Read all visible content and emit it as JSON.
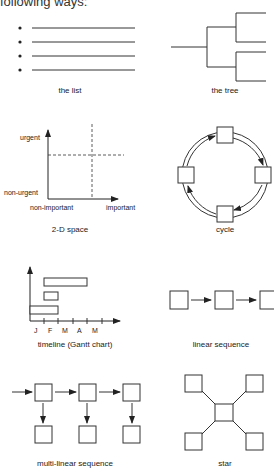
{
  "intro_text": "following ways:",
  "panels": {
    "list": {
      "caption": "the list"
    },
    "tree": {
      "caption": "the tree"
    },
    "space2d": {
      "caption": "2-D space",
      "y_top": "urgent",
      "y_bottom": "non-urgent",
      "x_left": "non-important",
      "x_right": "important"
    },
    "cycle": {
      "caption": "cycle"
    },
    "gantt": {
      "caption": "timeline (Gantt chart)",
      "months": [
        "J",
        "F",
        "M",
        "A",
        "M"
      ]
    },
    "linear": {
      "caption": "linear sequence"
    },
    "multilinear": {
      "caption": "multi-linear sequence"
    },
    "star": {
      "caption": "star"
    }
  }
}
